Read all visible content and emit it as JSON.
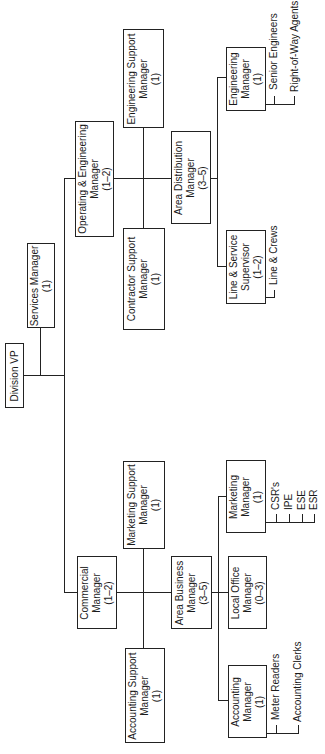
{
  "chart_data": {
    "type": "org_chart",
    "orientation": "rotated-90-ccw",
    "root": {
      "title": "Division VP",
      "children": [
        {
          "title": "Services Manager",
          "count": "(1)"
        },
        {
          "title": "Operating & Engineering Manager",
          "count": "(1–2)",
          "children": [
            {
              "title": "Engineering Support Manager",
              "count": "(1)"
            },
            {
              "title": "Contractor Support Manager",
              "count": "(1)"
            },
            {
              "title": "Area Distribution Manager",
              "count": "(3–5)",
              "children": [
                {
                  "title": "Engineering Manager",
                  "count": "(1)",
                  "reports": [
                    "Senior Engineers",
                    "Right-of-Way Agents"
                  ]
                },
                {
                  "title": "Line & Service Supervisor",
                  "count": "(1–2)",
                  "reports": [
                    "Line & Crews"
                  ]
                }
              ]
            }
          ]
        },
        {
          "title": "Commercial Manager",
          "count": "(1–2)",
          "children": [
            {
              "title": "Marketing Support Manager",
              "count": "(1)"
            },
            {
              "title": "Accounting Support Manager",
              "count": "(1)"
            },
            {
              "title": "Area Business Manager",
              "count": "(3–5)",
              "children": [
                {
                  "title": "Marketing Manager",
                  "count": "(1)",
                  "reports": [
                    "CSR's",
                    "IPE",
                    "ESE",
                    "ESR"
                  ]
                },
                {
                  "title": "Local Office Manager",
                  "count": "(0–3)"
                },
                {
                  "title": "Accounting Manager",
                  "count": "(1)",
                  "reports": [
                    "Meter Readers",
                    "Accounting Clerks"
                  ]
                }
              ]
            }
          ]
        }
      ]
    }
  },
  "boxes": {
    "division_vp": {
      "l1": "Division VP"
    },
    "services": {
      "l1": "Services Manager",
      "l2": "(1)"
    },
    "op_eng": {
      "l1": "Operating & Engineering",
      "l2": "Manager",
      "l3": "(1–2)"
    },
    "eng_support": {
      "l1": "Engineering Support",
      "l2": "Manager",
      "l3": "(1)"
    },
    "contractor": {
      "l1": "Contractor Support",
      "l2": "Manager",
      "l3": "(1)"
    },
    "area_dist": {
      "l1": "Area Distribution",
      "l2": "Manager",
      "l3": "(3–5)"
    },
    "eng_mgr": {
      "l1": "Engineering",
      "l2": "Manager",
      "l3": "(1)"
    },
    "line_service": {
      "l1": "Line & Service",
      "l2": "Supervisor",
      "l3": "(1–2)"
    },
    "commercial": {
      "l1": "Commercial",
      "l2": "Manager",
      "l3": "(1–2)"
    },
    "mkt_support": {
      "l1": "Marketing Support",
      "l2": "Manager",
      "l3": "(1)"
    },
    "acct_support": {
      "l1": "Accounting Support",
      "l2": "Manager",
      "l3": "(1)"
    },
    "area_business": {
      "l1": "Area Business",
      "l2": "Manager",
      "l3": "(3–5)"
    },
    "local_office": {
      "l1": "Local Office",
      "l2": "Manager",
      "l3": "(0–3)"
    },
    "mkt_mgr": {
      "l1": "Marketing",
      "l2": "Manager",
      "l3": "(1)"
    },
    "acct_mgr": {
      "l1": "Accounting",
      "l2": "Manager",
      "l3": "(1)"
    }
  },
  "leaves": {
    "senior_engineers": "Senior Engineers",
    "row_agents": "Right-of-Way Agents",
    "line_crews": "Line & Crews",
    "csrs": "CSR's",
    "ipe": "IPE",
    "ese": "ESE",
    "esr": "ESR",
    "meter_readers": "Meter Readers",
    "acct_clerks": "Accounting Clerks"
  }
}
